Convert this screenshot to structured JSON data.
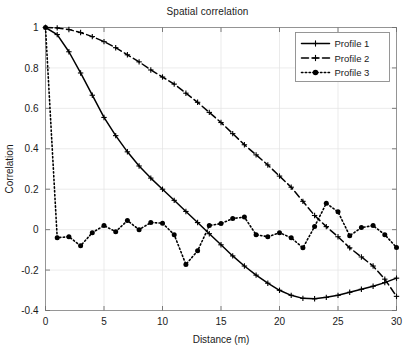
{
  "chart_data": {
    "type": "line",
    "title": "Spatial correlation",
    "xlabel": "Distance (m)",
    "ylabel": "Correlation",
    "xlim": [
      0,
      30
    ],
    "ylim": [
      -0.4,
      1.0
    ],
    "xticks": [
      0,
      5,
      10,
      15,
      20,
      25,
      30
    ],
    "yticks": [
      -0.4,
      -0.2,
      0,
      0.2,
      0.4,
      0.6,
      0.8,
      1
    ],
    "xtick_labels": [
      "0",
      "5",
      "10",
      "15",
      "20",
      "25",
      "30"
    ],
    "ytick_labels": [
      "-0.4",
      "-0.2",
      "0",
      "0.2",
      "0.4",
      "0.6",
      "0.8",
      "1"
    ],
    "grid": true,
    "legend_position": "upper right",
    "x": [
      0,
      1,
      2,
      3,
      4,
      5,
      6,
      7,
      8,
      9,
      10,
      11,
      12,
      13,
      14,
      15,
      16,
      17,
      18,
      19,
      20,
      21,
      22,
      23,
      24,
      25,
      26,
      27,
      28,
      29,
      30
    ],
    "series": [
      {
        "name": "Profile 1",
        "style": "solid",
        "marker": "plus",
        "color": "#000000",
        "values": [
          1.0,
          0.965,
          0.88,
          0.775,
          0.665,
          0.555,
          0.465,
          0.385,
          0.315,
          0.255,
          0.2,
          0.145,
          0.09,
          0.035,
          -0.02,
          -0.075,
          -0.13,
          -0.18,
          -0.225,
          -0.265,
          -0.3,
          -0.325,
          -0.34,
          -0.342,
          -0.335,
          -0.325,
          -0.31,
          -0.295,
          -0.28,
          -0.262,
          -0.24
        ]
      },
      {
        "name": "Profile 2",
        "style": "dashed",
        "marker": "plus",
        "color": "#000000",
        "values": [
          1.0,
          0.998,
          0.99,
          0.975,
          0.955,
          0.93,
          0.9,
          0.865,
          0.83,
          0.79,
          0.755,
          0.72,
          0.675,
          0.63,
          0.58,
          0.53,
          0.475,
          0.42,
          0.37,
          0.32,
          0.265,
          0.21,
          0.14,
          0.07,
          0.015,
          -0.035,
          -0.09,
          -0.135,
          -0.18,
          -0.245,
          -0.33
        ]
      },
      {
        "name": "Profile 3",
        "style": "dotted",
        "marker": "circle",
        "color": "#000000",
        "values": [
          1.0,
          -0.04,
          -0.035,
          -0.08,
          -0.015,
          0.02,
          -0.01,
          0.045,
          0.0,
          0.035,
          0.032,
          -0.025,
          -0.172,
          -0.105,
          0.02,
          0.03,
          0.055,
          0.062,
          -0.025,
          -0.035,
          -0.015,
          -0.04,
          -0.09,
          0.015,
          0.13,
          0.088,
          -0.03,
          0.01,
          0.02,
          -0.025,
          -0.088
        ]
      }
    ]
  },
  "legend": {
    "entries": [
      {
        "label": "Profile 1"
      },
      {
        "label": "Profile 2"
      },
      {
        "label": "Profile 3"
      }
    ]
  }
}
